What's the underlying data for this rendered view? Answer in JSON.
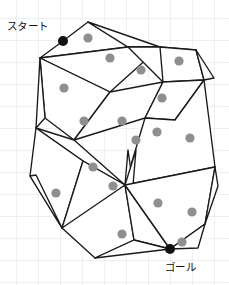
{
  "figure": {
    "width": 229,
    "height": 285,
    "background": "#ffffff",
    "grid": {
      "visible": true,
      "spacing": 22,
      "color": "#96a0aa"
    },
    "stroke_color": "#1a1a1a",
    "fill_color": "#ffffff",
    "node_color": "#8f8f8f",
    "terminal_color": "#111111"
  },
  "labels": {
    "start": "スタート",
    "goal": "ゴール"
  },
  "terminals": [
    {
      "name": "start",
      "x": 63,
      "y": 41,
      "r": 5.0
    },
    {
      "name": "goal",
      "x": 170,
      "y": 249,
      "r": 5.0
    }
  ],
  "nodes": [
    {
      "x": 88,
      "y": 38,
      "r": 4.6
    },
    {
      "x": 110,
      "y": 58,
      "r": 4.6
    },
    {
      "x": 141,
      "y": 70,
      "r": 4.6
    },
    {
      "x": 179,
      "y": 61,
      "r": 4.6
    },
    {
      "x": 64,
      "y": 88,
      "r": 4.6
    },
    {
      "x": 162,
      "y": 98,
      "r": 4.6
    },
    {
      "x": 84,
      "y": 121,
      "r": 4.6
    },
    {
      "x": 122,
      "y": 121,
      "r": 4.6
    },
    {
      "x": 157,
      "y": 132,
      "r": 4.6
    },
    {
      "x": 136,
      "y": 140,
      "r": 4.6
    },
    {
      "x": 190,
      "y": 138,
      "r": 4.6
    },
    {
      "x": 93,
      "y": 167,
      "r": 4.6
    },
    {
      "x": 56,
      "y": 193,
      "r": 4.6
    },
    {
      "x": 113,
      "y": 186,
      "r": 4.6
    },
    {
      "x": 158,
      "y": 203,
      "r": 4.6
    },
    {
      "x": 192,
      "y": 212,
      "r": 4.6
    },
    {
      "x": 122,
      "y": 234,
      "r": 4.6
    },
    {
      "x": 182,
      "y": 242,
      "r": 4.6
    }
  ],
  "cells": [
    {
      "name": "cell-top-left",
      "points": "40,58 63,41 88,22 128,47"
    },
    {
      "name": "cell-top-right",
      "points": "88,22 128,47 160,47"
    },
    {
      "name": "cell-upper-band",
      "points": "40,58 128,47 160,47 110,92"
    },
    {
      "name": "cell-upper-right-fan",
      "points": "128,47 160,47 196,50 163,82"
    },
    {
      "name": "cell-right-upper",
      "points": "160,47 196,50 204,80 163,82"
    },
    {
      "name": "cell-right-corner",
      "points": "196,50 214,78 204,80"
    },
    {
      "name": "cell-left-wedge",
      "points": "40,58 110,92 74,140 45,118"
    },
    {
      "name": "cell-left-lower",
      "points": "40,58 45,118 36,128"
    },
    {
      "name": "cell-mid-band",
      "points": "110,92 163,82 145,118 74,140"
    },
    {
      "name": "cell-mid-right",
      "points": "163,82 204,80 175,120 145,118"
    },
    {
      "name": "cell-center-right",
      "points": "145,118 175,120 204,80 215,167 125,185"
    },
    {
      "name": "cell-left-mid-long",
      "points": "36,128 74,140 125,185 83,161"
    },
    {
      "name": "cell-left-quad",
      "points": "36,128 83,161 62,228 30,176"
    },
    {
      "name": "cell-left-spur",
      "points": "30,176 62,228 36,175"
    },
    {
      "name": "cell-center-slab",
      "points": "83,161 125,185 78,223 62,228"
    },
    {
      "name": "cell-center-thin",
      "points": "125,185 128,150 133,185"
    },
    {
      "name": "cell-center-sliver",
      "points": "125,185 133,185 136,150"
    },
    {
      "name": "cell-bottom-left",
      "points": "62,228 125,185 134,240 95,258"
    },
    {
      "name": "cell-bottom-mid",
      "points": "125,185 170,249 134,240"
    },
    {
      "name": "cell-bottom-right",
      "points": "125,185 215,167 205,224 170,249"
    },
    {
      "name": "cell-bottom-corner",
      "points": "170,249 205,224 198,248"
    },
    {
      "name": "cell-bottom-tail",
      "points": "95,258 134,240 170,249"
    },
    {
      "name": "cell-right-lower",
      "points": "215,167 205,224 218,186"
    }
  ]
}
